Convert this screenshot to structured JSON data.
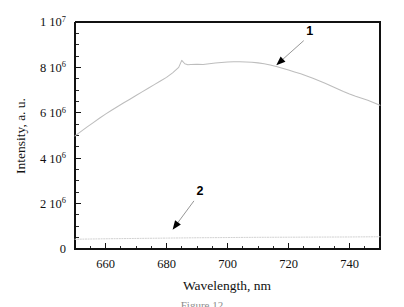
{
  "figure": {
    "caption": "Figure 12",
    "background_color": "#ffffff",
    "frame_color": "#111111"
  },
  "chart_data": {
    "type": "line",
    "title": "",
    "subtitle": "",
    "xlabel": "Wavelength, nm",
    "ylabel": "Intensity, a. u.",
    "xlim": [
      650,
      750
    ],
    "ylim": [
      0,
      10000000
    ],
    "grid": false,
    "legend_position": "inline-annotations",
    "x_ticks": [
      660,
      680,
      700,
      720,
      740
    ],
    "x_tick_labels": [
      "660",
      "680",
      "700",
      "720",
      "740"
    ],
    "x_minor_tick_step": 5,
    "y_ticks": [
      0,
      2000000,
      4000000,
      6000000,
      8000000,
      10000000
    ],
    "y_tick_labels": [
      "0",
      "2 10",
      "4 10",
      "6 10",
      "8 10",
      "1 10"
    ],
    "y_tick_exponents": [
      "",
      "6",
      "6",
      "6",
      "6",
      "7"
    ],
    "y_minor_tick_step": 500000,
    "series": [
      {
        "name": "1",
        "color": "#bdbdbd",
        "style": "solid",
        "x": [
          650,
          652,
          654,
          656,
          658,
          660,
          662,
          664,
          666,
          668,
          670,
          672,
          674,
          676,
          678,
          680,
          682,
          684,
          685,
          686,
          687,
          688,
          690,
          692,
          694,
          696,
          698,
          700,
          702,
          704,
          706,
          708,
          710,
          712,
          714,
          716,
          718,
          720,
          722,
          724,
          726,
          728,
          730,
          732,
          734,
          736,
          738,
          740,
          742,
          744,
          746,
          748,
          750
        ],
        "y": [
          4980000,
          5180000,
          5380000,
          5570000,
          5760000,
          5940000,
          6110000,
          6280000,
          6440000,
          6600000,
          6760000,
          6920000,
          7080000,
          7240000,
          7400000,
          7560000,
          7760000,
          8000000,
          8310000,
          8160000,
          8120000,
          8130000,
          8140000,
          8130000,
          8160000,
          8190000,
          8220000,
          8240000,
          8250000,
          8250000,
          8240000,
          8230000,
          8200000,
          8160000,
          8110000,
          8040000,
          7960000,
          7880000,
          7800000,
          7720000,
          7620000,
          7520000,
          7410000,
          7300000,
          7180000,
          7060000,
          6940000,
          6830000,
          6730000,
          6640000,
          6550000,
          6440000,
          6330000
        ]
      },
      {
        "name": "2",
        "color": "#cfcfcf",
        "style": "dotted",
        "x": [
          650,
          660,
          670,
          680,
          690,
          700,
          710,
          720,
          730,
          740,
          750
        ],
        "y": [
          430000,
          450000,
          465000,
          480000,
          495000,
          505000,
          515000,
          520000,
          525000,
          530000,
          540000
        ]
      }
    ],
    "annotations": [
      {
        "label": "1",
        "label_x": 727,
        "label_y": 9420000,
        "arrow_from_x": 725,
        "arrow_from_y": 9180000,
        "arrow_to_x": 716,
        "arrow_to_y": 8100000
      },
      {
        "label": "2",
        "label_x": 691,
        "label_y": 2360000,
        "arrow_from_x": 689,
        "arrow_from_y": 2120000,
        "arrow_to_x": 682,
        "arrow_to_y": 850000
      }
    ]
  }
}
